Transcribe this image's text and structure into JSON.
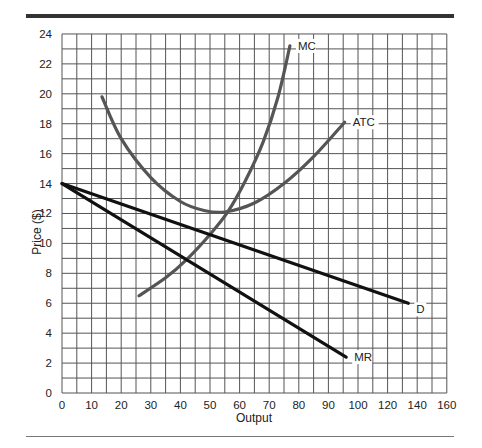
{
  "chart_data": {
    "type": "line",
    "title": "",
    "xlabel": "Output",
    "ylabel": "Price ($)",
    "x_ticks": [
      0,
      10,
      20,
      30,
      40,
      50,
      60,
      70,
      80,
      90,
      100,
      120,
      140,
      160
    ],
    "y_ticks": [
      0,
      2,
      4,
      6,
      8,
      10,
      12,
      14,
      16,
      18,
      20,
      22,
      24
    ],
    "xlim": [
      0,
      160
    ],
    "ylim": [
      0,
      24
    ],
    "grid": true,
    "legend": "inline labels at curve ends",
    "series": [
      {
        "name": "MC",
        "label": "MC",
        "color": "#555555",
        "points": [
          [
            26,
            6.5
          ],
          [
            35,
            7.7
          ],
          [
            42,
            8.9
          ],
          [
            50,
            10.6
          ],
          [
            56,
            12.1
          ],
          [
            62,
            14.2
          ],
          [
            68,
            16.8
          ],
          [
            73,
            19.8
          ],
          [
            77,
            23.2
          ]
        ]
      },
      {
        "name": "ATC",
        "label": "ATC",
        "color": "#555555",
        "points": [
          [
            13.5,
            19.8
          ],
          [
            20,
            17.0
          ],
          [
            30,
            14.4
          ],
          [
            40,
            12.8
          ],
          [
            48,
            12.2
          ],
          [
            55,
            12.1
          ],
          [
            65,
            12.7
          ],
          [
            75,
            14.0
          ],
          [
            85,
            15.8
          ],
          [
            95.5,
            18.1
          ]
        ]
      },
      {
        "name": "D",
        "label": "D",
        "color": "#111111",
        "points": [
          [
            0,
            14
          ],
          [
            134,
            6
          ]
        ]
      },
      {
        "name": "MR",
        "label": "MR",
        "color": "#111111",
        "points": [
          [
            0,
            14
          ],
          [
            96,
            2.4
          ]
        ]
      }
    ]
  }
}
